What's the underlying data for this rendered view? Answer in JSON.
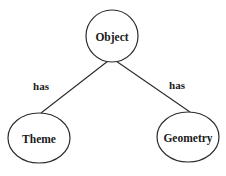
{
  "diagram": {
    "type": "tree",
    "nodes": [
      {
        "id": "object",
        "label": "Object"
      },
      {
        "id": "theme",
        "label": "Theme"
      },
      {
        "id": "geometry",
        "label": "Geometry"
      }
    ],
    "edges": [
      {
        "from": "object",
        "to": "theme",
        "label": "has"
      },
      {
        "from": "object",
        "to": "geometry",
        "label": "has"
      }
    ]
  },
  "colors": {
    "stroke": "#2a2a2a",
    "text": "#1a1a1a",
    "background": "#ffffff"
  }
}
